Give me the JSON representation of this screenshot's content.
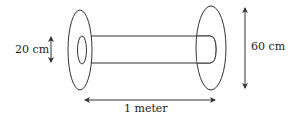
{
  "diagram": {
    "labels": {
      "inner_diameter": "20 cm",
      "outer_diameter": "60 cm",
      "length": "1 meter"
    },
    "colors": {
      "stroke": "#333333",
      "background": "#ffffff"
    }
  }
}
